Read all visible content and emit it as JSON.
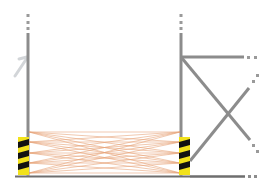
{
  "diagram": {
    "colors": {
      "post": "#8c8c8c",
      "beam": "#e08a5a",
      "stripe_yellow": "#f2e21b",
      "stripe_black": "#111111",
      "floor": "#6e6e6e",
      "arrow": "#b8bcc0"
    },
    "left_post": {
      "x": 28,
      "top": 14,
      "bottom": 176
    },
    "right_post": {
      "x": 181,
      "top": 14,
      "bottom": 176
    },
    "beam_points_y": [
      132,
      142,
      153,
      163,
      173
    ],
    "guards": [
      {
        "name": "left-guard",
        "x": 19,
        "y": 137,
        "w": 11,
        "h": 38
      },
      {
        "name": "right-guard",
        "x": 179,
        "y": 137,
        "w": 11,
        "h": 38
      }
    ],
    "brace": {
      "horizontal": {
        "x1": 181,
        "y1": 57,
        "x2": 248,
        "y2": 57
      },
      "diag1": {
        "x1": 181,
        "y1": 57,
        "x2": 252,
        "y2": 140
      },
      "diag2": {
        "x1": 190,
        "y1": 160,
        "x2": 250,
        "y2": 85
      },
      "floor_right": {
        "x1": 190,
        "y1": 176,
        "x2": 256,
        "y2": 176
      }
    }
  }
}
